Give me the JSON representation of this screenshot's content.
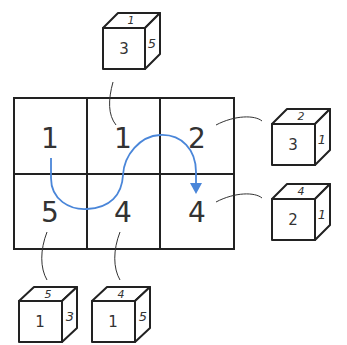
{
  "grid": {
    "rows": 2,
    "cols": 3,
    "cells": [
      [
        "1",
        "1",
        "2"
      ],
      [
        "5",
        "4",
        "4"
      ]
    ]
  },
  "path": {
    "description": "Blue curved arrow rolling path from top-left cell down, through bottom-left, up through middle, over top-right, ending with arrowhead into bottom-right cell",
    "color": "#4a86d9"
  },
  "cubes": [
    {
      "id": "cube-top-middle",
      "front": "3",
      "right": "5",
      "top": "1",
      "attached_to": "cell-0-1"
    },
    {
      "id": "cube-right-top",
      "front": "3",
      "right": "1",
      "top": "2",
      "attached_to": "cell-0-2"
    },
    {
      "id": "cube-right-bottom",
      "front": "2",
      "right": "1",
      "top": "4",
      "attached_to": "cell-1-2"
    },
    {
      "id": "cube-bottom-left",
      "front": "1",
      "right": "3",
      "top": "5",
      "attached_to": "cell-1-0"
    },
    {
      "id": "cube-bottom-middle",
      "front": "1",
      "right": "5",
      "top": "4",
      "attached_to": "cell-1-1"
    }
  ],
  "colors": {
    "line": "#222222",
    "text": "#333333",
    "arrow": "#4a86d9"
  }
}
